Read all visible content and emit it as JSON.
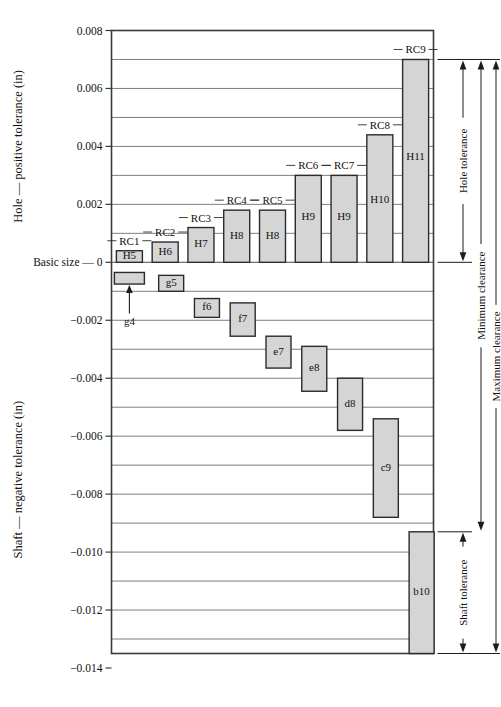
{
  "chart_data": {
    "type": "bar",
    "title": "",
    "subtitle": "",
    "xlabel": "",
    "ylabel_top": "Hole — positive tolerance (in)",
    "ylabel_bottom": "Shaft — negative tolerance (in)",
    "zero_label": "Basic size — 0",
    "ylim": [
      -0.014,
      0.008
    ],
    "grid": true,
    "grid_step": 0.001,
    "legend": "none",
    "units": "in",
    "y_ticks": [
      {
        "value": 0.008,
        "label": "0.008"
      },
      {
        "value": 0.006,
        "label": "0.006"
      },
      {
        "value": 0.004,
        "label": "0.004"
      },
      {
        "value": 0.002,
        "label": "0.002"
      },
      {
        "value": 0.0,
        "label": "0"
      },
      {
        "value": -0.002,
        "label": "-0.002"
      },
      {
        "value": -0.004,
        "label": "-0.004"
      },
      {
        "value": -0.006,
        "label": "-0.006"
      },
      {
        "value": -0.008,
        "label": "-0.008"
      },
      {
        "value": -0.01,
        "label": "-0.010"
      },
      {
        "value": -0.012,
        "label": "-0.012"
      },
      {
        "value": -0.014,
        "label": "-0.014"
      }
    ],
    "gridline_values": [
      0.007,
      0.005,
      0.003,
      0.001,
      -0.001,
      -0.003,
      -0.005,
      -0.007,
      -0.009,
      -0.011,
      -0.013
    ],
    "categories": [
      "RC1",
      "RC2",
      "RC3",
      "RC4",
      "RC5",
      "RC6",
      "RC7",
      "RC8",
      "RC9"
    ],
    "series": [
      {
        "name": "Hole tolerance zones",
        "bars": [
          {
            "fit": "RC1",
            "grade": "H5",
            "low": 0.0,
            "high": 0.0004
          },
          {
            "fit": "RC2",
            "grade": "H6",
            "low": 0.0,
            "high": 0.0007
          },
          {
            "fit": "RC3",
            "grade": "H7",
            "low": 0.0,
            "high": 0.0012
          },
          {
            "fit": "RC4",
            "grade": "H8",
            "low": 0.0,
            "high": 0.0018
          },
          {
            "fit": "RC5",
            "grade": "H8",
            "low": 0.0,
            "high": 0.0018
          },
          {
            "fit": "RC6",
            "grade": "H9",
            "low": 0.0,
            "high": 0.003
          },
          {
            "fit": "RC7",
            "grade": "H9",
            "low": 0.0,
            "high": 0.003
          },
          {
            "fit": "RC8",
            "grade": "H10",
            "low": 0.0,
            "high": 0.0044
          },
          {
            "fit": "RC9",
            "grade": "H11",
            "low": 0.0,
            "high": 0.007
          }
        ]
      },
      {
        "name": "Shaft tolerance zones",
        "bars": [
          {
            "fit": "RC1",
            "grade": "g4",
            "low": -0.00075,
            "high": -0.00035
          },
          {
            "fit": "RC2",
            "grade": "g5",
            "low": -0.001,
            "high": -0.00045
          },
          {
            "fit": "RC3",
            "grade": "f6",
            "low": -0.0019,
            "high": -0.00125
          },
          {
            "fit": "RC4",
            "grade": "f7",
            "low": -0.00255,
            "high": -0.0014
          },
          {
            "fit": "RC5",
            "grade": "e7",
            "low": -0.00365,
            "high": -0.00255
          },
          {
            "fit": "RC6",
            "grade": "e8",
            "low": -0.00445,
            "high": -0.0029
          },
          {
            "fit": "RC7",
            "grade": "d8",
            "low": -0.0058,
            "high": -0.004
          },
          {
            "fit": "RC8",
            "grade": "c9",
            "low": -0.0088,
            "high": -0.0054
          },
          {
            "fit": "RC9",
            "grade": "b10",
            "low": -0.0135,
            "high": -0.0093
          }
        ]
      }
    ],
    "annotations": [
      {
        "name": "g4-callout",
        "text": "g4"
      }
    ],
    "brackets": [
      {
        "name": "hole-tolerance",
        "text": "Hole tolerance",
        "from": 0.007,
        "to": 0.0
      },
      {
        "name": "minimum-clearance",
        "text": "Minimum clearance",
        "from": 0.007,
        "to": -0.0093
      },
      {
        "name": "maximum-clearance",
        "text": "Maximum clearance",
        "from": 0.007,
        "to": -0.0135
      },
      {
        "name": "shaft-tolerance",
        "text": "Shaft tolerance",
        "from": -0.0093,
        "to": -0.0135
      }
    ],
    "colors": {
      "bar_fill": "#d5d5d5",
      "bar_stroke": "#2b2b2b",
      "grid": "#6f6f6f",
      "frame": "#3a3a3a",
      "text": "#111111",
      "background": "#ffffff"
    }
  }
}
